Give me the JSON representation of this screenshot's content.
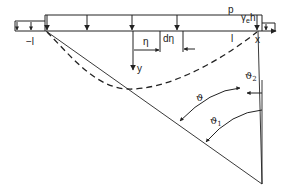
{
  "diagram": {
    "type": "load-distribution-geometry",
    "labels": {
      "neg_l": "−l",
      "pos_l": "l",
      "x_axis": "x",
      "y_axis": "y",
      "p": "p",
      "gamma_e_h": "γ",
      "gamma_sub": "e",
      "h": "h",
      "eta": "η",
      "d_eta": "dη",
      "theta": "ϑ",
      "theta1": "ϑ",
      "theta1_sub": "1",
      "theta2": "ϑ",
      "theta2_sub": "2"
    },
    "colors": {
      "stroke": "#222222",
      "background": "#ffffff"
    }
  }
}
